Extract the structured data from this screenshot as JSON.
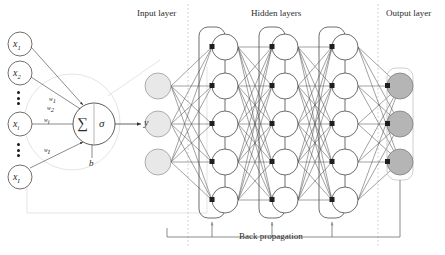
{
  "figure": {
    "layer_titles": {
      "input": "Input layer",
      "hidden": "Hidden layers",
      "output": "Output layer"
    },
    "caption": "Back propagation"
  },
  "neuron": {
    "inputs": [
      {
        "name": "input-x1",
        "base": "x",
        "sub": "1"
      },
      {
        "name": "input-x2",
        "base": "x",
        "sub": "2"
      },
      {
        "name": "input-xi",
        "base": "x",
        "sub": "i"
      },
      {
        "name": "input-xI",
        "base": "x",
        "sub": "I"
      }
    ],
    "weights": [
      {
        "name": "weight-w1",
        "base": "w",
        "sub": "1"
      },
      {
        "name": "weight-w2",
        "base": "w",
        "sub": "2"
      },
      {
        "name": "weight-wi",
        "base": "w",
        "sub": "i"
      },
      {
        "name": "weight-wI",
        "base": "w",
        "sub": "I"
      }
    ],
    "summation_symbol": "∑",
    "activation_symbol": "σ",
    "bias_label": "b",
    "output_label": "y"
  },
  "network": {
    "input_layer": {
      "label": "Input layer",
      "node_count": 3,
      "fill": "#e8e8e8"
    },
    "hidden_layers": [
      {
        "label": "Hidden layer 1",
        "node_count": 5,
        "fill": "#ffffff"
      },
      {
        "label": "Hidden layer 2",
        "node_count": 5,
        "fill": "#ffffff"
      },
      {
        "label": "Hidden layer 3",
        "node_count": 5,
        "fill": "#ffffff"
      }
    ],
    "output_layer": {
      "label": "Output layer",
      "node_count": 3,
      "fill": "#b5b5b5"
    },
    "backprop": {
      "label": "Back propagation",
      "arrow_count": 3
    }
  },
  "colors": {
    "stroke": "#3a3a3a",
    "light_stroke": "#c9c9c9",
    "text": "#2b2b2b",
    "input_node_fill": "#e8e8e8",
    "output_node_fill": "#b5b5b5",
    "hidden_node_fill": "#ffffff"
  }
}
